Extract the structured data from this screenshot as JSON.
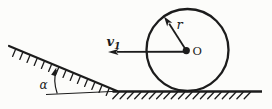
{
  "diagram": {
    "labels": {
      "velocity_symbol": "v",
      "velocity_subscript": "1",
      "radius_symbol": "r",
      "center_symbol": "O",
      "angle_symbol": "α"
    },
    "colors": {
      "ink": "#1c1c1c",
      "paper": "#fcfcfa"
    }
  }
}
